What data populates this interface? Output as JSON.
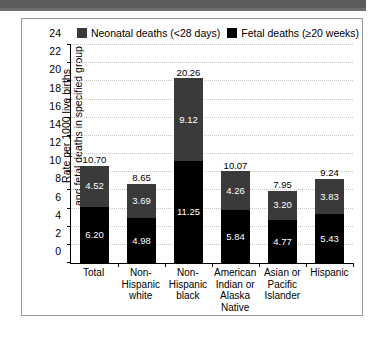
{
  "header": {
    "bar_present": true
  },
  "legend": {
    "entries": [
      {
        "label": "Neonatal deaths (<28 days)",
        "color": "#3a3a3a",
        "key": "neonatal"
      },
      {
        "label": "Fetal deaths (≥20 weeks)",
        "color": "#000000",
        "key": "fetal"
      }
    ]
  },
  "axis": {
    "y_title_line1": "Rate per 1000 live births",
    "y_title_line2": "and fetal deaths in specified group"
  },
  "chart_data": {
    "type": "bar",
    "stacked": true,
    "title": "",
    "subtitle": "",
    "xlabel": "",
    "ylabel": "Rate per 1000 live births and fetal deaths in specified group",
    "ylim": [
      0,
      24
    ],
    "yticks": [
      0,
      2,
      4,
      6,
      8,
      10,
      12,
      14,
      16,
      18,
      20,
      22,
      24
    ],
    "ytick_labels": [
      "0",
      "2",
      "4",
      "6",
      "8",
      "10",
      "12",
      "14",
      "16",
      "18",
      "20",
      "22",
      "24"
    ],
    "grid": true,
    "legend_position": "top",
    "categories": [
      "Total",
      "Non-Hispanic white",
      "Non-Hispanic black",
      "American Indian or Alaska Native",
      "Asian or Pacific Islander",
      "Hispanic"
    ],
    "category_label_lines": [
      [
        "Total"
      ],
      [
        "Non-",
        "Hispanic",
        "white"
      ],
      [
        "Non-",
        "Hispanic",
        "black"
      ],
      [
        "American",
        "Indian or",
        "Alaska",
        "Native"
      ],
      [
        "Asian or",
        "Pacific",
        "Islander"
      ],
      [
        "Hispanic"
      ]
    ],
    "series": [
      {
        "name": "Fetal deaths (≥20 weeks)",
        "key": "fetal",
        "color": "#000000",
        "values": [
          6.2,
          4.98,
          11.25,
          5.84,
          4.77,
          5.43
        ],
        "value_labels": [
          "6.20",
          "4.98",
          "11.25",
          "5.84",
          "4.77",
          "5.43"
        ]
      },
      {
        "name": "Neonatal deaths (<28 days)",
        "key": "neonatal",
        "color": "#3a3a3a",
        "values": [
          4.52,
          3.69,
          9.12,
          4.26,
          3.2,
          3.83
        ],
        "value_labels": [
          "4.52",
          "3.69",
          "9.12",
          "4.26",
          "3.20",
          "3.83"
        ]
      }
    ],
    "totals": [
      10.7,
      8.65,
      20.26,
      10.07,
      7.95,
      9.24
    ],
    "total_labels": [
      "10.70",
      "8.65",
      "20.26",
      "10.07",
      "7.95",
      "9.24"
    ]
  }
}
